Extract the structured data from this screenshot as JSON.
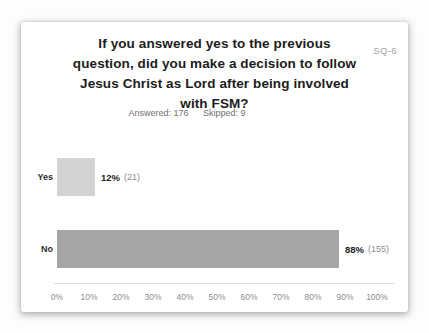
{
  "slide": {
    "code": "SQ-6",
    "title_lines": [
      "If you answered yes to the previous",
      "question, did you make a decision to follow",
      "Jesus Christ as Lord after being involved",
      "with FSM?"
    ],
    "stats": {
      "answered_label": "Answered:",
      "answered_value": "176",
      "skipped_label": "Skipped:",
      "skipped_value": "9"
    }
  },
  "chart_data": {
    "type": "bar",
    "orientation": "horizontal",
    "title": "If you answered yes to the previous question, did you make a decision to follow Jesus Christ as Lord after being involved with FSM?",
    "categories": [
      "Yes",
      "No"
    ],
    "values": [
      12,
      88
    ],
    "counts": [
      21,
      155
    ],
    "value_labels": [
      "12%",
      "88%"
    ],
    "count_labels": [
      "(21)",
      "(155)"
    ],
    "answered": 176,
    "skipped": 9,
    "xlim": [
      0,
      100
    ],
    "x_ticks": [
      "0%",
      "10%",
      "20%",
      "30%",
      "40%",
      "50%",
      "60%",
      "70%",
      "80%",
      "90%",
      "100%"
    ],
    "grid": false,
    "legend": null,
    "bar_colors": [
      "#d3d3d3",
      "#a6a6a6"
    ],
    "axis_line_color": "#dedede"
  }
}
